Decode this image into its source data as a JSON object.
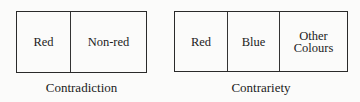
{
  "diagrams": [
    {
      "caption": "Contradiction",
      "cells": [
        "Red",
        "Non-red"
      ]
    },
    {
      "caption": "Contrariety",
      "cells": [
        "Red",
        "Blue",
        "Other Colours"
      ]
    }
  ],
  "extra": {
    "other_line1": "Other",
    "other_line2": "Colours"
  }
}
